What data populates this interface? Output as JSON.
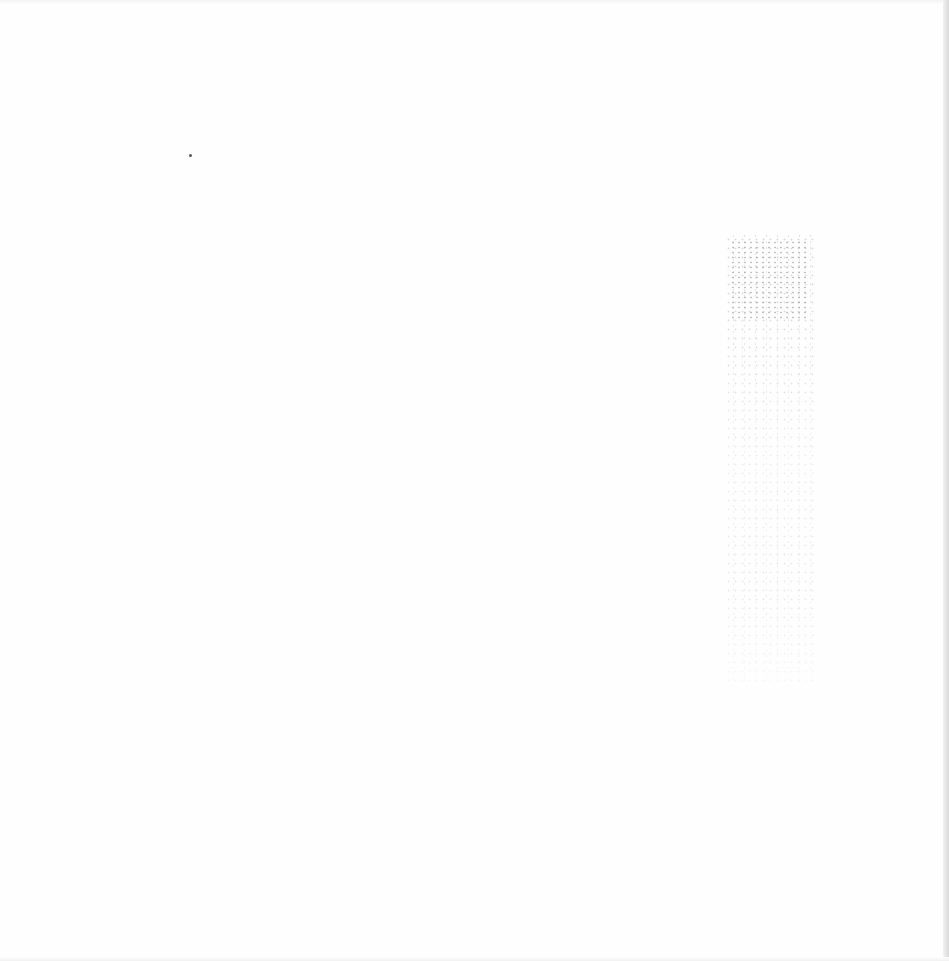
{
  "page": {
    "type": "blank-scanned-page",
    "background_color": "#fefefe",
    "edge_shadow_color": "#d9d9d9",
    "marks": [
      {
        "kind": "speck",
        "x": 190,
        "y": 155
      },
      {
        "kind": "bleed-through-noise",
        "x": 725,
        "y": 235,
        "width": 90,
        "height": 450
      }
    ],
    "text": ""
  }
}
